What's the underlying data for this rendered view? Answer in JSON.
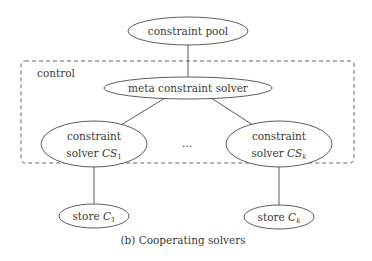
{
  "diagram": {
    "caption": "(b) Cooperating solvers",
    "group": {
      "label": "control"
    },
    "nodes": {
      "pool": {
        "label": "constraint pool"
      },
      "meta": {
        "label": "meta constraint solver"
      },
      "solver1": {
        "line1": "constraint",
        "line2_prefix": "solver ",
        "var": "CS",
        "sub": "1"
      },
      "solverk": {
        "line1": "constraint",
        "line2_prefix": "solver ",
        "var": "CS",
        "sub": "k"
      },
      "store1": {
        "prefix": "store ",
        "var": "C",
        "sub": "1"
      },
      "storek": {
        "prefix": "store ",
        "var": "C",
        "sub": "k"
      }
    },
    "ellipsis": "…",
    "edges": [
      [
        "pool",
        "meta"
      ],
      [
        "meta",
        "solver1"
      ],
      [
        "meta",
        "solverk"
      ],
      [
        "solver1",
        "store1"
      ],
      [
        "solverk",
        "storek"
      ]
    ]
  },
  "colors": {
    "stroke": "#4a4a4a",
    "text": "#3a3a3a",
    "background": "#ffffff"
  }
}
